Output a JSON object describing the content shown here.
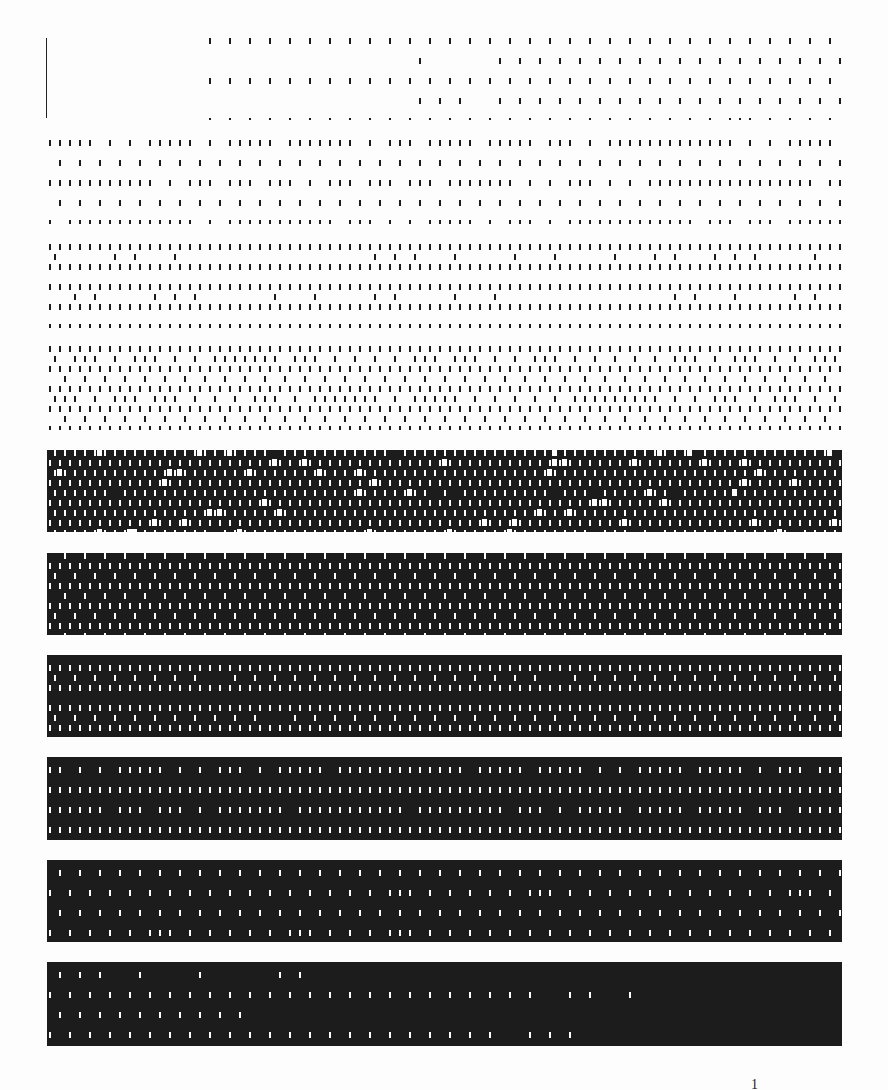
{
  "document": {
    "type": "halftone-dither-test-page",
    "page_number": "1",
    "ink_color": "#1c1c1c",
    "paper_color": "#fdfdfd",
    "left_marker": "vertical-rule",
    "bands": [
      {
        "index": 1,
        "top": 38,
        "height": 82,
        "level": 0.06,
        "style": "sparse-dashes-gradient"
      },
      {
        "index": 2,
        "top": 140,
        "height": 84,
        "level": 0.16,
        "style": "dashes"
      },
      {
        "index": 3,
        "top": 244,
        "height": 84,
        "level": 0.28,
        "style": "dashes"
      },
      {
        "index": 4,
        "top": 346,
        "height": 84,
        "level": 0.4,
        "style": "dashes"
      },
      {
        "index": 5,
        "top": 450,
        "height": 82,
        "level": 0.52,
        "style": "dashes-with-holes"
      },
      {
        "index": 6,
        "top": 553,
        "height": 82,
        "level": 0.62,
        "style": "inverse-dashes"
      },
      {
        "index": 7,
        "top": 655,
        "height": 82,
        "level": 0.7,
        "style": "inverse-dashes"
      },
      {
        "index": 8,
        "top": 757,
        "height": 83,
        "level": 0.78,
        "style": "inverse-dashes"
      },
      {
        "index": 9,
        "top": 860,
        "height": 82,
        "level": 0.86,
        "style": "inverse-dashes"
      },
      {
        "index": 10,
        "top": 962,
        "height": 84,
        "level": 0.94,
        "style": "inverse-sparse-gradient"
      }
    ]
  }
}
